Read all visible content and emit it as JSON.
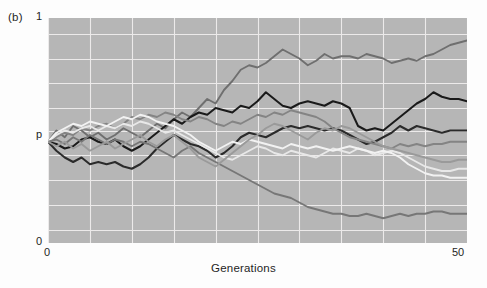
{
  "figure": {
    "panel_label": "(b)",
    "xlabel": "Generations",
    "y_top_label": "1",
    "y_mid_label": "p",
    "y_bottom_label": "0",
    "x_start_label": "0",
    "x_end_label": "50",
    "plot_background": "#b6b6b6",
    "grid_color": "#eceaea"
  },
  "chart_data": {
    "type": "line",
    "title": "",
    "subtitle": "",
    "xlabel": "Generations",
    "ylabel": "",
    "xlim": [
      0,
      50
    ],
    "ylim": [
      0,
      1
    ],
    "xticks": [
      0,
      50
    ],
    "yticks": [
      0,
      1
    ],
    "ytick_labels": [
      "0",
      "1"
    ],
    "y_reference_line": {
      "label": "p",
      "value": 0.45
    },
    "grid": true,
    "grid_x": [
      0,
      5,
      10,
      15,
      20,
      25,
      30,
      35,
      40,
      45,
      50
    ],
    "grid_y": [
      0.06,
      0.17,
      0.28,
      0.39,
      0.5,
      0.6,
      0.71,
      0.82,
      0.93
    ],
    "legend": "none",
    "legend_position": "none",
    "annotations": [
      "(b)"
    ],
    "x": [
      0,
      1,
      2,
      3,
      4,
      5,
      6,
      7,
      8,
      9,
      10,
      11,
      12,
      13,
      14,
      15,
      16,
      17,
      18,
      19,
      20,
      21,
      22,
      23,
      24,
      25,
      26,
      27,
      28,
      29,
      30,
      31,
      32,
      33,
      34,
      35,
      36,
      37,
      38,
      39,
      40,
      41,
      42,
      43,
      44,
      45,
      46,
      47,
      48,
      49,
      50
    ],
    "series": [
      {
        "name": "trajectory-1",
        "color": "#6f6f6f",
        "width": 1.9,
        "values": [
          0.45,
          0.5,
          0.47,
          0.52,
          0.5,
          0.47,
          0.49,
          0.46,
          0.48,
          0.51,
          0.49,
          0.47,
          0.5,
          0.53,
          0.51,
          0.55,
          0.58,
          0.56,
          0.6,
          0.64,
          0.62,
          0.68,
          0.72,
          0.77,
          0.79,
          0.78,
          0.8,
          0.83,
          0.86,
          0.84,
          0.82,
          0.79,
          0.81,
          0.84,
          0.82,
          0.83,
          0.83,
          0.82,
          0.84,
          0.83,
          0.82,
          0.8,
          0.81,
          0.82,
          0.81,
          0.83,
          0.84,
          0.86,
          0.88,
          0.89,
          0.9
        ]
      },
      {
        "name": "trajectory-2",
        "color": "#1a1a1a",
        "width": 2.0,
        "values": [
          0.45,
          0.44,
          0.42,
          0.43,
          0.46,
          0.47,
          0.45,
          0.44,
          0.46,
          0.43,
          0.41,
          0.43,
          0.46,
          0.49,
          0.52,
          0.55,
          0.53,
          0.56,
          0.58,
          0.57,
          0.6,
          0.59,
          0.58,
          0.61,
          0.6,
          0.63,
          0.67,
          0.64,
          0.61,
          0.6,
          0.62,
          0.63,
          0.62,
          0.61,
          0.63,
          0.62,
          0.6,
          0.52,
          0.5,
          0.51,
          0.5,
          0.53,
          0.56,
          0.59,
          0.62,
          0.64,
          0.67,
          0.65,
          0.64,
          0.64,
          0.63
        ]
      },
      {
        "name": "trajectory-3",
        "color": "#2b2b2b",
        "width": 2.0,
        "values": [
          0.45,
          0.41,
          0.38,
          0.36,
          0.38,
          0.35,
          0.36,
          0.35,
          0.36,
          0.34,
          0.33,
          0.35,
          0.38,
          0.42,
          0.45,
          0.48,
          0.46,
          0.44,
          0.43,
          0.41,
          0.38,
          0.4,
          0.43,
          0.47,
          0.49,
          0.48,
          0.47,
          0.49,
          0.51,
          0.52,
          0.51,
          0.52,
          0.51,
          0.5,
          0.51,
          0.5,
          0.48,
          0.46,
          0.44,
          0.45,
          0.47,
          0.49,
          0.52,
          0.5,
          0.52,
          0.51,
          0.5,
          0.49,
          0.5,
          0.5,
          0.5
        ]
      },
      {
        "name": "trajectory-4",
        "color": "#848484",
        "width": 1.9,
        "values": [
          0.45,
          0.47,
          0.49,
          0.48,
          0.51,
          0.5,
          0.52,
          0.53,
          0.51,
          0.53,
          0.56,
          0.55,
          0.57,
          0.56,
          0.58,
          0.57,
          0.55,
          0.54,
          0.56,
          0.55,
          0.53,
          0.52,
          0.54,
          0.53,
          0.55,
          0.57,
          0.56,
          0.58,
          0.57,
          0.59,
          0.58,
          0.57,
          0.56,
          0.54,
          0.51,
          0.49,
          0.47,
          0.46,
          0.45,
          0.44,
          0.43,
          0.42,
          0.44,
          0.43,
          0.44,
          0.43,
          0.44,
          0.44,
          0.45,
          0.45,
          0.45
        ]
      },
      {
        "name": "trajectory-5",
        "color": "#e8e8e8",
        "width": 1.9,
        "values": [
          0.45,
          0.48,
          0.5,
          0.49,
          0.51,
          0.52,
          0.5,
          0.52,
          0.51,
          0.53,
          0.52,
          0.54,
          0.53,
          0.51,
          0.49,
          0.5,
          0.48,
          0.46,
          0.44,
          0.42,
          0.4,
          0.38,
          0.37,
          0.39,
          0.41,
          0.43,
          0.42,
          0.4,
          0.39,
          0.41,
          0.4,
          0.39,
          0.38,
          0.4,
          0.42,
          0.41,
          0.4,
          0.42,
          0.41,
          0.39,
          0.4,
          0.41,
          0.4,
          0.38,
          0.36,
          0.34,
          0.33,
          0.32,
          0.32,
          0.33,
          0.33
        ]
      },
      {
        "name": "trajectory-6",
        "color": "#f2f2f2",
        "width": 1.9,
        "values": [
          0.45,
          0.49,
          0.51,
          0.53,
          0.52,
          0.54,
          0.53,
          0.52,
          0.54,
          0.56,
          0.55,
          0.57,
          0.56,
          0.54,
          0.53,
          0.52,
          0.5,
          0.48,
          0.45,
          0.43,
          0.41,
          0.43,
          0.45,
          0.44,
          0.46,
          0.45,
          0.44,
          0.43,
          0.42,
          0.44,
          0.43,
          0.42,
          0.43,
          0.42,
          0.41,
          0.42,
          0.43,
          0.42,
          0.41,
          0.4,
          0.41,
          0.4,
          0.38,
          0.35,
          0.33,
          0.31,
          0.3,
          0.3,
          0.29,
          0.29,
          0.29
        ]
      },
      {
        "name": "trajectory-7",
        "color": "#777777",
        "width": 1.9,
        "values": [
          0.45,
          0.46,
          0.44,
          0.47,
          0.45,
          0.48,
          0.46,
          0.44,
          0.46,
          0.45,
          0.43,
          0.45,
          0.44,
          0.42,
          0.4,
          0.38,
          0.41,
          0.43,
          0.4,
          0.38,
          0.36,
          0.34,
          0.32,
          0.3,
          0.28,
          0.26,
          0.24,
          0.22,
          0.21,
          0.2,
          0.18,
          0.16,
          0.15,
          0.14,
          0.13,
          0.13,
          0.12,
          0.12,
          0.13,
          0.12,
          0.11,
          0.12,
          0.13,
          0.12,
          0.13,
          0.13,
          0.14,
          0.14,
          0.13,
          0.13,
          0.13
        ]
      },
      {
        "name": "trajectory-8",
        "color": "#9a9a9a",
        "width": 1.9,
        "values": [
          0.45,
          0.43,
          0.45,
          0.42,
          0.44,
          0.41,
          0.43,
          0.45,
          0.42,
          0.44,
          0.46,
          0.48,
          0.45,
          0.43,
          0.46,
          0.48,
          0.45,
          0.42,
          0.38,
          0.36,
          0.34,
          0.37,
          0.4,
          0.43,
          0.46,
          0.48,
          0.51,
          0.53,
          0.52,
          0.5,
          0.48,
          0.46,
          0.49,
          0.51,
          0.5,
          0.52,
          0.51,
          0.49,
          0.47,
          0.45,
          0.43,
          0.42,
          0.41,
          0.4,
          0.39,
          0.38,
          0.37,
          0.36,
          0.36,
          0.37,
          0.37
        ]
      }
    ]
  }
}
